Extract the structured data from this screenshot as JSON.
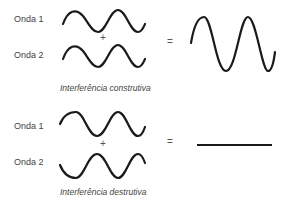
{
  "constructive": {
    "wave1_label": "Onda 1",
    "wave2_label": "Onda 2",
    "plus": "+",
    "equals": "=",
    "caption": "Interferência construtiva"
  },
  "destructive": {
    "wave1_label": "Onda 1",
    "wave2_label": "Onda 2",
    "plus": "+",
    "equals": "=",
    "caption": "Interferência destrutiva"
  },
  "colors": {
    "stroke": "#1a1a1a",
    "text": "#444444"
  }
}
